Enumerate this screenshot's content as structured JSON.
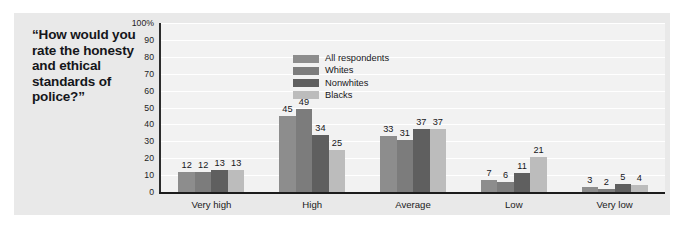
{
  "question": "“How would you rate the honesty and ethical standards of police?”",
  "chart_data": {
    "type": "bar",
    "title": "“How would you rate the honesty and ethical standards of police?”",
    "xlabel": "",
    "ylabel": "",
    "ylim": [
      0,
      100
    ],
    "grid": true,
    "legend_position": "top-center-inside",
    "categories": [
      "Very high",
      "High",
      "Average",
      "Low",
      "Very low"
    ],
    "series": [
      {
        "name": "All respondents",
        "color": "#8d8d8d",
        "values": [
          12,
          45,
          33,
          7,
          3
        ]
      },
      {
        "name": "Whites",
        "color": "#7c7c7c",
        "values": [
          12,
          49,
          31,
          6,
          2
        ]
      },
      {
        "name": "Nonwhites",
        "color": "#5f5f5f",
        "values": [
          13,
          34,
          37,
          11,
          5
        ]
      },
      {
        "name": "Blacks",
        "color": "#bcbcbc",
        "values": [
          13,
          25,
          37,
          21,
          4
        ]
      }
    ],
    "yticks": [
      {
        "value": 100,
        "label": "100%"
      },
      {
        "value": 90,
        "label": "90"
      },
      {
        "value": 80,
        "label": "80"
      },
      {
        "value": 70,
        "label": "70"
      },
      {
        "value": 60,
        "label": "60"
      },
      {
        "value": 50,
        "label": "50"
      },
      {
        "value": 40,
        "label": "40"
      },
      {
        "value": 30,
        "label": "30"
      },
      {
        "value": 20,
        "label": "20"
      },
      {
        "value": 10,
        "label": "10"
      },
      {
        "value": 0,
        "label": "0"
      }
    ]
  },
  "colors": {
    "panel_background": "#e9e9e9",
    "plot_background": "#f2f2f2",
    "gridline": "#ffffff",
    "axis": "#1c1c1c",
    "text": "#17171a"
  }
}
